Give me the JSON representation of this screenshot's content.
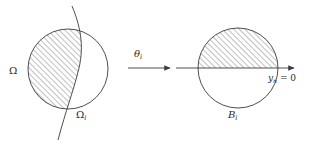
{
  "figure": {
    "name": "domain-flattening-diagram",
    "background_color": "#ffffff",
    "stroke_color": "#3a3a3a",
    "hatch_color": "#555555",
    "labels": {
      "omega": "Ω",
      "omega_sub": "",
      "omega_i_base": "Ω",
      "omega_i_sub": "i",
      "theta_base": "θ",
      "theta_sub": "i",
      "ball_base": "B",
      "ball_sub": "i",
      "plane_base": "y",
      "plane_sub": "n",
      "plane_rest": " = 0"
    },
    "left_panel": {
      "name": "original-domain",
      "circle": {
        "cx": 68,
        "cy": 69,
        "r": 40
      },
      "boundary_curve_description": "curved interface crossing the disc",
      "hatched_side": "left-of-curve"
    },
    "right_panel": {
      "name": "flattened-ball",
      "circle": {
        "cx": 238,
        "cy": 68,
        "r": 40
      },
      "plane_line_y": 68,
      "hatched_side": "upper-half"
    },
    "map_arrow": {
      "name": "mapping-arrow",
      "x1": 128,
      "x2": 172,
      "y": 68
    },
    "axis_arrow": {
      "name": "axis-arrow",
      "x1": 176,
      "x2": 296,
      "y": 68
    }
  }
}
